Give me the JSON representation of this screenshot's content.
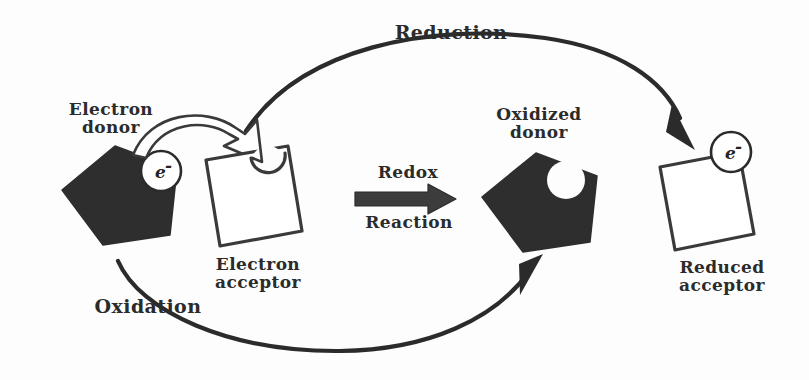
{
  "diagram": {
    "background_color": "#fdfdfd",
    "ink_color": "#2b2b2b",
    "shape_fill_dark": "#2e2e2e",
    "shape_fill_light": "#ffffff"
  },
  "labels": {
    "electron_donor": "Electron\ndonor",
    "electron_acceptor": "Electron\nacceptor",
    "oxidized_donor": "Oxidized\ndonor",
    "reduced_acceptor": "Reduced\nacceptor",
    "reduction": "Reduction",
    "oxidation": "Oxidation",
    "redox_top": "Redox",
    "redox_bottom": "Reaction",
    "electron_symbol": "e",
    "electron_charge": "-"
  },
  "shapes": [
    {
      "name": "electron-donor-pentagon",
      "kind": "pentagon",
      "fill": "#2e2e2e",
      "has_electron": true,
      "has_notch": false
    },
    {
      "name": "electron-acceptor-square",
      "kind": "square-with-notch",
      "fill": "#ffffff",
      "has_electron": false,
      "has_notch": true
    },
    {
      "name": "oxidized-donor-pentagon",
      "kind": "pentagon-with-notch",
      "fill": "#2e2e2e",
      "has_electron": false,
      "has_notch": true
    },
    {
      "name": "reduced-acceptor-square",
      "kind": "square",
      "fill": "#ffffff",
      "has_electron": true,
      "has_notch": false
    }
  ],
  "arrows": [
    {
      "name": "electron-transfer-arrow",
      "style": "hollow-outline",
      "from": "electron-donor-pentagon",
      "to": "electron-acceptor-square"
    },
    {
      "name": "redox-reaction-arrow",
      "style": "solid-block",
      "from": "electron-acceptor-square",
      "to": "oxidized-donor-pentagon"
    },
    {
      "name": "reduction-arc-arrow",
      "style": "solid-curve",
      "from": "electron-acceptor-square",
      "to": "reduced-acceptor-square"
    },
    {
      "name": "oxidation-arc-arrow",
      "style": "solid-curve",
      "from": "electron-donor-pentagon",
      "to": "oxidized-donor-pentagon"
    }
  ]
}
